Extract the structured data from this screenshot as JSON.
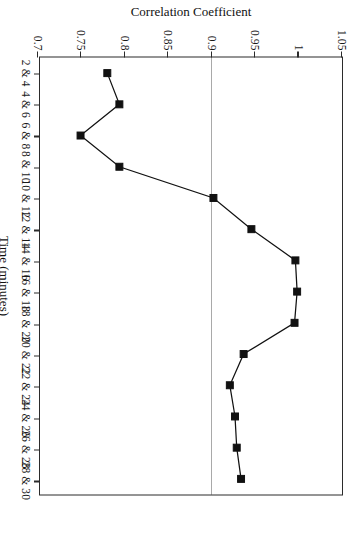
{
  "chart_data": {
    "type": "line",
    "title": "",
    "subtitle": "",
    "xlabel": "Time (minutes)",
    "ylabel": "Correlation Coefficient",
    "categories": [
      "2 & 4",
      "4 & 6",
      "6 & 8",
      "8 & 10",
      "10 & 12",
      "12 & 14",
      "14 & 16",
      "16 & 18",
      "18 & 20",
      "20 & 22",
      "22 & 24",
      "24 & 26",
      "26 & 28",
      "28 & 30"
    ],
    "series": [
      {
        "name": "Correlation Coefficient",
        "values": [
          0.778,
          0.792,
          0.747,
          0.792,
          0.901,
          0.945,
          0.996,
          0.998,
          0.995,
          0.936,
          0.92,
          0.926,
          0.928,
          0.933
        ],
        "marker": "filled-square",
        "color": "#111111"
      }
    ],
    "ylim": [
      0.7,
      1.05
    ],
    "yticks": [
      0.7,
      0.75,
      0.8,
      0.85,
      0.9,
      0.95,
      1.0,
      1.05
    ],
    "ytick_labels": [
      "0.7",
      "0.75",
      "0.8",
      "0.85",
      "0.9",
      "0.95",
      "1",
      "1.05"
    ],
    "grid": false,
    "legend": false,
    "legend_position": "none",
    "annotations": [
      {
        "type": "threshold-line",
        "axis": "y",
        "value": 0.9,
        "style": "dotted",
        "color": "#555555"
      }
    ],
    "orientation": "rotated-90",
    "axis_color": "#2b2b2b",
    "background": "#ffffff"
  }
}
